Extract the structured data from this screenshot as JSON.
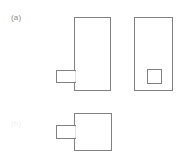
{
  "figure": {
    "background_color": "#ffffff",
    "stroke_color": "#808080",
    "fill_color": "#ffffff",
    "stroke_width": 1,
    "width": 183,
    "height": 161
  },
  "labels": {
    "panel_a": "(a)",
    "panel_b": "(b)"
  },
  "chart_data": {
    "type": "diagram",
    "title": "",
    "units": "px",
    "shapes": [
      {
        "name": "upper-left-body",
        "kind": "rect",
        "x": 74,
        "y": 17,
        "width": 36,
        "height": 73
      },
      {
        "name": "upper-left-tab",
        "kind": "rect",
        "x": 56,
        "y": 70,
        "width": 19,
        "height": 12
      },
      {
        "name": "upper-right-body",
        "kind": "rect",
        "x": 134,
        "y": 17,
        "width": 38,
        "height": 73
      },
      {
        "name": "upper-right-inner-square",
        "kind": "rect",
        "x": 147,
        "y": 69,
        "width": 14,
        "height": 14
      },
      {
        "name": "lower-body",
        "kind": "rect",
        "x": 74,
        "y": 113,
        "width": 37,
        "height": 37
      },
      {
        "name": "lower-tab",
        "kind": "rect",
        "x": 56,
        "y": 125,
        "width": 19,
        "height": 13
      }
    ]
  }
}
